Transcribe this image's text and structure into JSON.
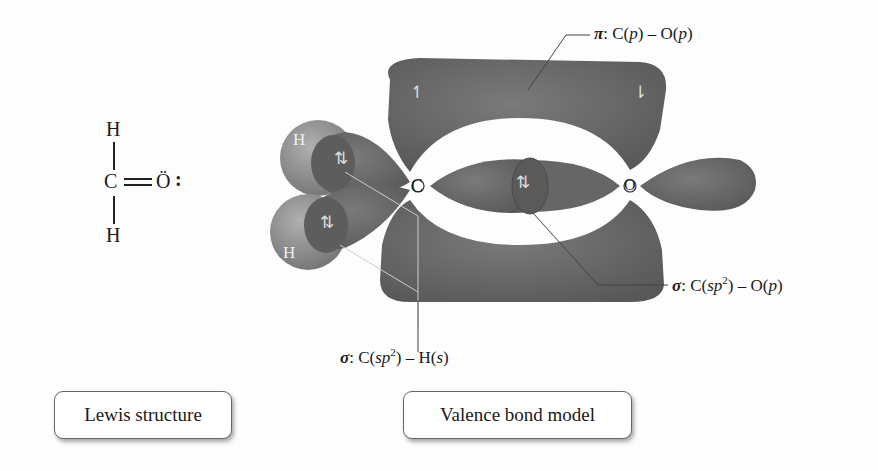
{
  "lewis": {
    "atoms": {
      "top_h": "H",
      "carbon": "C",
      "oxygen": "Ö",
      "oxygen_lone_pair": ":",
      "bottom_h": "H"
    },
    "bond": "double"
  },
  "model": {
    "atom_labels": {
      "carbon": "C",
      "oxygen": "O",
      "h_top": "H",
      "h_bottom": "H"
    },
    "electron_symbols": {
      "pair": "⇅",
      "up": "↿",
      "down": "⇂"
    }
  },
  "labels": {
    "pi": {
      "symbol": "π",
      "text": ": C(",
      "orb1": "p",
      "mid": ") – O(",
      "orb2": "p",
      "end": ")"
    },
    "sigma_co": {
      "symbol": "σ",
      "text": ": C(",
      "orb1": "sp",
      "sup": "2",
      "mid": ") – O(",
      "orb2": "p",
      "end": ")"
    },
    "sigma_ch": {
      "symbol": "σ",
      "text": ": C(",
      "orb1": "sp",
      "sup": "2",
      "mid": ") – H(",
      "orb2": "s",
      "end": ")"
    }
  },
  "captions": {
    "lewis": "Lewis structure",
    "valence": "Valence bond model"
  },
  "colors": {
    "lobe": "#6e6e6e",
    "lobe_dark": "#555555",
    "h_sphere": "#8a8a8a",
    "text": "#1a1a1a"
  }
}
